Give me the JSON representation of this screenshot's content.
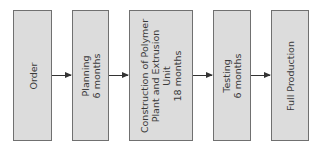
{
  "diagram": {
    "type": "flowchart",
    "direction": "left-to-right",
    "steps": [
      {
        "label": "Order"
      },
      {
        "label": "Planning\n6 months"
      },
      {
        "label": "Construction of Polymer\nPlant and Extrusion\nUnit\n18 months"
      },
      {
        "label": "Testing\n6 months"
      },
      {
        "label": "Full Production"
      }
    ],
    "colors": {
      "box_fill": "#dcdcdc",
      "box_border": "#707070",
      "arrow": "#333333",
      "text": "#3a3a3a"
    }
  }
}
